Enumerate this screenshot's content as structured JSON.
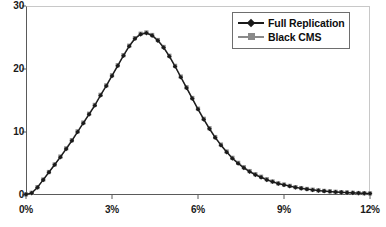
{
  "chart_data": {
    "type": "line",
    "title": "",
    "subtitle": "",
    "xlabel": "",
    "ylabel": "",
    "xlim": [
      0,
      12
    ],
    "ylim": [
      0,
      30
    ],
    "grid": false,
    "legend_position": "top-right",
    "x_tick_labels": [
      "0%",
      "3%",
      "6%",
      "9%",
      "12%"
    ],
    "x_tick_values": [
      0,
      3,
      6,
      9,
      12
    ],
    "y_tick_labels": [
      "0",
      "10",
      "20",
      "30"
    ],
    "y_tick_values": [
      0,
      10,
      20,
      30
    ],
    "x": [
      0.0,
      0.2,
      0.4,
      0.6,
      0.8,
      1.0,
      1.2,
      1.4,
      1.6,
      1.8,
      2.0,
      2.2,
      2.4,
      2.6,
      2.8,
      3.0,
      3.2,
      3.4,
      3.6,
      3.8,
      4.0,
      4.2,
      4.4,
      4.6,
      4.8,
      5.0,
      5.2,
      5.4,
      5.6,
      5.8,
      6.0,
      6.2,
      6.4,
      6.6,
      6.8,
      7.0,
      7.2,
      7.4,
      7.6,
      7.8,
      8.0,
      8.2,
      8.4,
      8.6,
      8.8,
      9.0,
      9.2,
      9.4,
      9.6,
      9.8,
      10.0,
      10.2,
      10.4,
      10.6,
      10.8,
      11.0,
      11.2,
      11.4,
      11.6,
      11.8,
      12.0
    ],
    "series": [
      {
        "name": "Full Replication",
        "color": "#1a1a1a",
        "marker": "diamond",
        "values": [
          0.1,
          0.3,
          1.2,
          2.4,
          3.6,
          4.8,
          6.0,
          7.3,
          8.6,
          10.0,
          11.4,
          12.8,
          14.2,
          15.8,
          17.3,
          18.9,
          20.5,
          22.1,
          23.6,
          24.8,
          25.5,
          25.7,
          25.3,
          24.5,
          23.4,
          22.0,
          20.4,
          18.7,
          17.0,
          15.3,
          13.6,
          12.0,
          10.5,
          9.1,
          7.9,
          6.8,
          5.8,
          5.0,
          4.3,
          3.7,
          3.2,
          2.8,
          2.4,
          2.1,
          1.8,
          1.6,
          1.4,
          1.2,
          1.05,
          0.92,
          0.8,
          0.7,
          0.62,
          0.55,
          0.48,
          0.42,
          0.37,
          0.33,
          0.29,
          0.26,
          0.23
        ]
      },
      {
        "name": "Black CMS",
        "color": "#8a8a8a",
        "marker": "square",
        "values": [
          0.1,
          0.35,
          1.25,
          2.45,
          3.65,
          4.85,
          6.1,
          7.4,
          8.7,
          10.1,
          11.5,
          12.9,
          14.3,
          15.9,
          17.4,
          19.0,
          20.6,
          22.2,
          23.7,
          24.9,
          25.6,
          25.8,
          25.4,
          24.6,
          23.5,
          22.1,
          20.5,
          18.8,
          17.1,
          15.4,
          13.7,
          12.1,
          10.6,
          9.2,
          8.0,
          6.9,
          5.9,
          5.1,
          4.4,
          3.8,
          3.3,
          2.9,
          2.5,
          2.15,
          1.85,
          1.65,
          1.45,
          1.25,
          1.1,
          0.96,
          0.84,
          0.74,
          0.65,
          0.58,
          0.51,
          0.45,
          0.4,
          0.35,
          0.31,
          0.28,
          0.25
        ]
      }
    ]
  },
  "legend": {
    "items": [
      {
        "label": "Full Replication",
        "color": "#1a1a1a",
        "marker": "diamond"
      },
      {
        "label": "Black CMS",
        "color": "#8a8a8a",
        "marker": "square"
      }
    ]
  },
  "axes": {
    "y_labels": [
      "30",
      "20",
      "10",
      "0"
    ],
    "x_labels": [
      "0%",
      "3%",
      "6%",
      "9%",
      "12%"
    ]
  },
  "colors": {
    "series_full_replication": "#1a1a1a",
    "series_black_cms": "#8a8a8a",
    "axis": "#5a5a5a",
    "frame": "#c8c8c8",
    "background": "#ffffff",
    "text": "#1a1a1a"
  }
}
